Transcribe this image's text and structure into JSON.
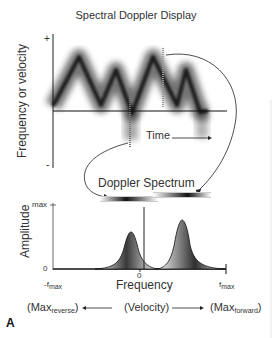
{
  "title": "Spectral Doppler Display",
  "top_panel": {
    "y_axis_label": "Frequency or velocity",
    "y_plus": "+",
    "y_minus": "-",
    "time_label": "Time",
    "waveform_points": [
      [
        53,
        106
      ],
      [
        79,
        57
      ],
      [
        101,
        105
      ],
      [
        116,
        70
      ],
      [
        132,
        113
      ],
      [
        153,
        57
      ],
      [
        177,
        105
      ],
      [
        186,
        70
      ],
      [
        200,
        112
      ],
      [
        208,
        111
      ]
    ]
  },
  "spectrum_label": "Doppler Spectrum",
  "bottom_panel": {
    "y_axis_label": "Amplitude",
    "y_max": "max",
    "y_zero": "0",
    "x_zero": "0",
    "x_min_base": "-f",
    "x_min_sub": "max",
    "x_max_base": "f",
    "x_max_sub": "max",
    "x_axis_label": "Frequency",
    "peaks": [
      {
        "name": "reverse",
        "center_x": 130,
        "height_y": 232
      },
      {
        "name": "forward",
        "center_x": 182,
        "height_y": 220
      }
    ]
  },
  "velocity_row": {
    "left_base": "(Max",
    "left_sub": "reverse",
    "left_close": ")",
    "center": "(Velocity)",
    "right_base": "(Max",
    "right_sub": "forward",
    "right_close": ")"
  },
  "panel_letter": "A",
  "colors": {
    "ink": "#222222",
    "background": "#ffffff"
  }
}
